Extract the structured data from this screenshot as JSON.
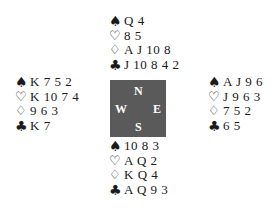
{
  "diagram": {
    "type": "bridge-deal",
    "hands": {
      "north": {
        "spades": "Q 4",
        "hearts": "8 5",
        "diamonds": "A J 10 8",
        "clubs": "J 10 8 4 2"
      },
      "west": {
        "spades": "K 7 5 2",
        "hearts": "K 10 7 4",
        "diamonds": "9 6 3",
        "clubs": "K 7"
      },
      "east": {
        "spades": "A J 9 6",
        "hearts": "J 9 6 3",
        "diamonds": "7 5 2",
        "clubs": "6 5"
      },
      "south": {
        "spades": "10 8 3",
        "hearts": "A Q 2",
        "diamonds": "K Q 4",
        "clubs": "A Q 9 3"
      }
    },
    "suit_symbols": {
      "spades": "♠",
      "hearts": "♡",
      "diamonds": "♢",
      "clubs": "♣"
    },
    "compass": {
      "north": "N",
      "south": "S",
      "west": "W",
      "east": "E",
      "background_color": "#5a5a5a",
      "text_color": "#ffffff"
    }
  }
}
